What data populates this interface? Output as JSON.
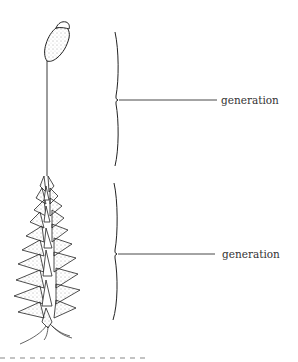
{
  "diagram": {
    "labels": [
      {
        "id": "upper",
        "text": "generation",
        "points_to": "sporophyte (capsule and seta)"
      },
      {
        "id": "lower",
        "text": "generation",
        "points_to": "gametophyte (leafy shoot)"
      }
    ],
    "parts": [
      "capsule",
      "seta",
      "leafy-shoot",
      "rhizoids"
    ],
    "colors": {
      "ink": "#222222",
      "text": "#333333",
      "background": "#ffffff",
      "dash": "#888888"
    }
  }
}
